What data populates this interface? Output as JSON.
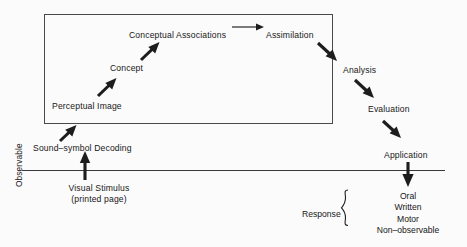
{
  "diagram": {
    "background_color": "#fbfbfb",
    "ink_color": "#1d1d1d",
    "inner_box": {
      "name": "non-observable-process-box",
      "has_border": true
    },
    "divider": {
      "name": "observable-boundary-line",
      "orientation": "horizontal"
    },
    "axis_label": "Observable",
    "nodes": [
      {
        "id": "perceptual_image",
        "label": "Perceptual Image"
      },
      {
        "id": "concept",
        "label": "Concept"
      },
      {
        "id": "conceptual_associations",
        "label": "Conceptual Associations"
      },
      {
        "id": "assimilation",
        "label": "Assimilation"
      },
      {
        "id": "analysis",
        "label": "Analysis"
      },
      {
        "id": "evaluation",
        "label": "Evaluation"
      },
      {
        "id": "application",
        "label": "Application"
      },
      {
        "id": "sound_symbol_decoding",
        "label": "Sound–symbol Decoding"
      },
      {
        "id": "visual_stimulus_line1",
        "label": "Visual Stimulus"
      },
      {
        "id": "visual_stimulus_line2",
        "label": "(printed page)"
      },
      {
        "id": "response",
        "label": "Response"
      }
    ],
    "response_options": [
      "Oral",
      "Written",
      "Motor",
      "Non–observable"
    ],
    "flow": [
      {
        "from": "visual_stimulus",
        "to": "sound_symbol_decoding",
        "style": "thick-up"
      },
      {
        "from": "sound_symbol_decoding",
        "to": "perceptual_image",
        "style": "thick-up-right"
      },
      {
        "from": "perceptual_image",
        "to": "concept",
        "style": "thick-up-right"
      },
      {
        "from": "concept",
        "to": "conceptual_associations",
        "style": "thick-up-right"
      },
      {
        "from": "conceptual_associations",
        "to": "assimilation",
        "style": "thin-right"
      },
      {
        "from": "assimilation",
        "to": "analysis",
        "style": "thick-down-right"
      },
      {
        "from": "analysis",
        "to": "evaluation",
        "style": "thick-down-right"
      },
      {
        "from": "evaluation",
        "to": "application",
        "style": "thick-down-right"
      },
      {
        "from": "application",
        "to": "response",
        "style": "thick-down"
      }
    ]
  }
}
